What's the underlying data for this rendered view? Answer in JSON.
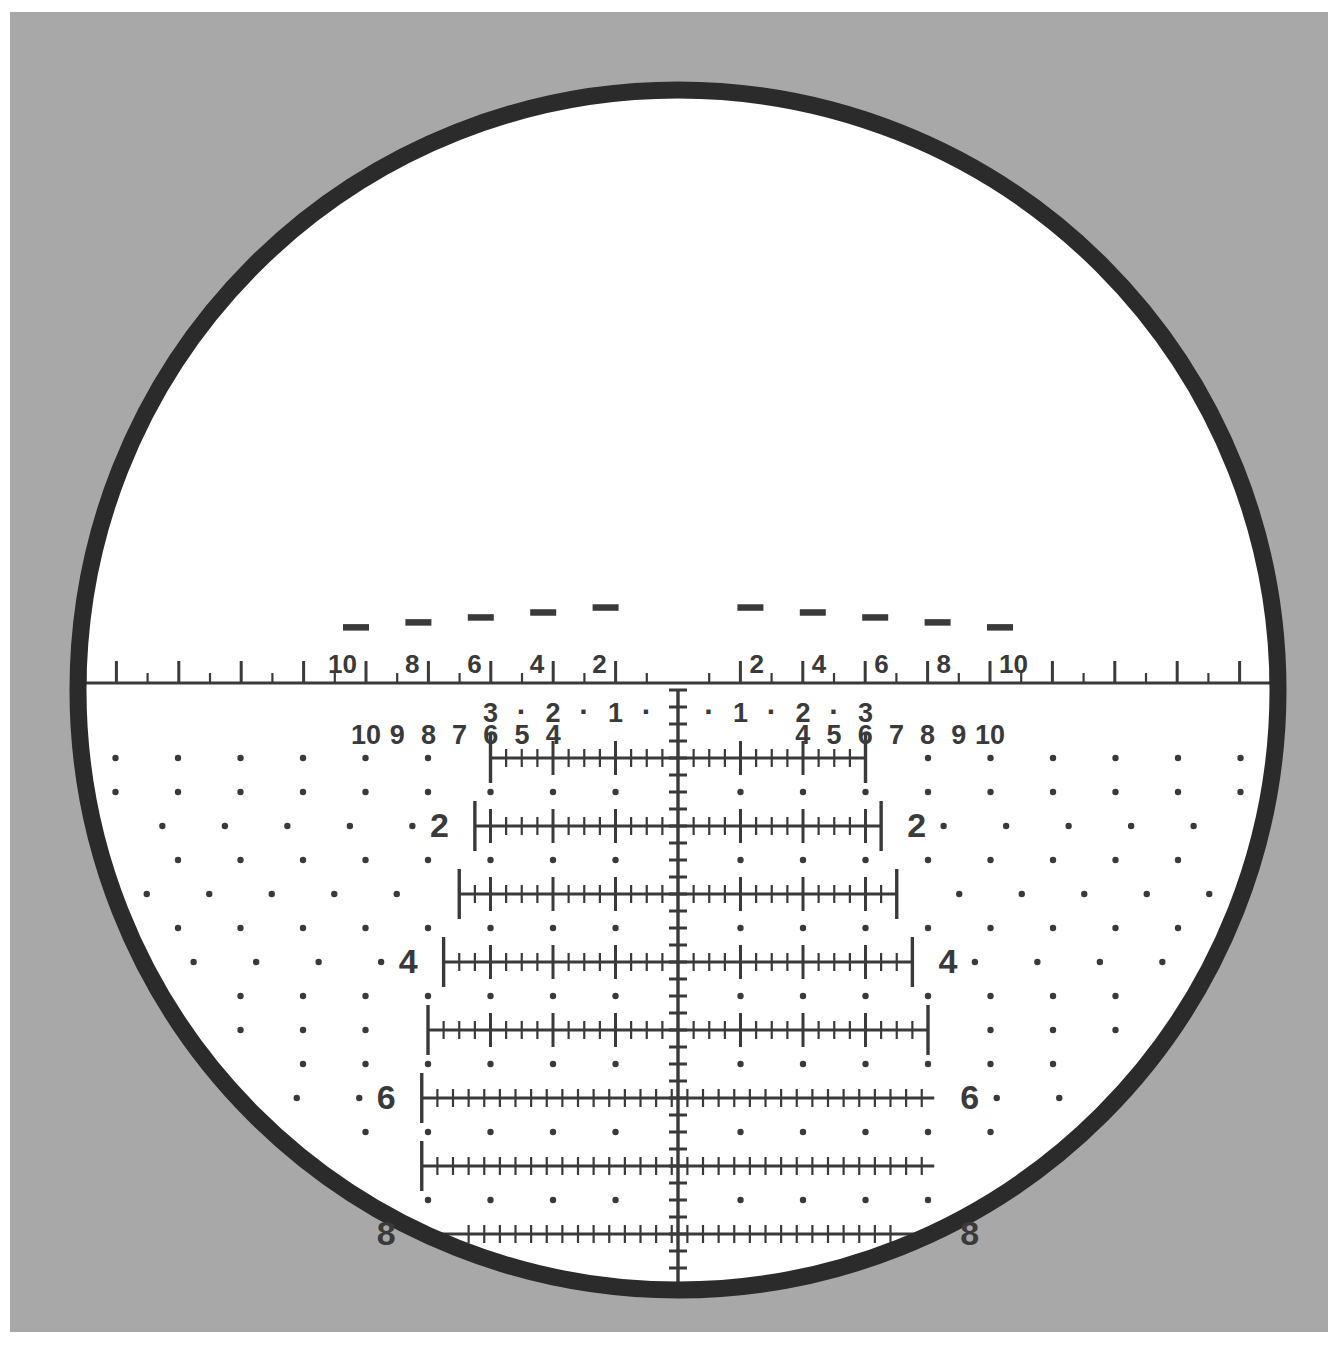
{
  "view": {
    "title": "Riflescope Reticle View",
    "background_color": "#a8a8a8",
    "page_color": "#ffffff",
    "field_color": "#ffffff",
    "ring_color": "#2b2b2b",
    "reticle_color": "#3a3a3a",
    "width": 1338,
    "height": 1354
  },
  "scope": {
    "center_x": 678,
    "center_y": 690,
    "field_radius": 600,
    "ring_thickness": 17,
    "name": "scope-field"
  },
  "center_post": {
    "name": "center-aiming-post",
    "description": "bulb shaped post with thin vertical stem",
    "stem_top_y": 550,
    "bulb_bottom_y": 688,
    "bulb_half_width": 27
  },
  "top_windage_scale": {
    "name": "top-windage-scale",
    "axis_y": 683,
    "left_end_x": 52,
    "right_end_x": 1304,
    "px_per_unit": 31.2,
    "minor_tick_len": 10,
    "major_tick_len": 22,
    "label_offset_y": -8,
    "labels_left": [
      "10",
      "8",
      "6",
      "4",
      "2"
    ],
    "labels_right": [
      "2",
      "4",
      "6",
      "8",
      "10"
    ],
    "label_values_left": [
      10,
      8,
      6,
      4,
      2
    ],
    "label_values_right": [
      2,
      4,
      6,
      8,
      10
    ],
    "dash_marks": {
      "name": "ranging-dash-marks",
      "values": [
        10,
        8,
        6,
        4,
        2
      ],
      "dash_width": 26,
      "dash_heights_px": [
        22,
        30,
        38,
        46,
        54
      ]
    }
  },
  "lower_windage_numbers": {
    "name": "lower-windage-number-row",
    "row_y": 744,
    "left": [
      "10",
      "9",
      "8",
      "7",
      "6",
      "5",
      "4"
    ],
    "right": [
      "4",
      "5",
      "6",
      "7",
      "8",
      "9",
      "10"
    ],
    "left_values": [
      10,
      9,
      8,
      7,
      6,
      5,
      4
    ],
    "right_values": [
      4,
      5,
      6,
      7,
      8,
      9,
      10
    ]
  },
  "center_windage_row": {
    "name": "center-windage-label-row",
    "row_y": 722,
    "left": [
      "3",
      "·",
      "2",
      "·",
      "1",
      "·"
    ],
    "right": [
      "·",
      "1",
      "·",
      "2",
      "·",
      "3"
    ],
    "left_values": [
      3,
      2.5,
      2,
      1.5,
      1,
      0.5
    ],
    "right_values": [
      0.5,
      1,
      1.5,
      2,
      2.5,
      3
    ]
  },
  "holdover_ladder": {
    "name": "holdover-ladder",
    "unit_px": 62.5,
    "row_spacing_px": 68,
    "first_row_y": 758,
    "rows": [
      {
        "index": 1,
        "label": "",
        "y": 758,
        "half_width_units": 3.0,
        "labeled": false
      },
      {
        "index": 2,
        "label": "2",
        "y": 826,
        "half_width_units": 3.25,
        "labeled": true
      },
      {
        "index": 3,
        "label": "",
        "y": 894,
        "half_width_units": 3.5,
        "labeled": false
      },
      {
        "index": 4,
        "label": "4",
        "y": 962,
        "half_width_units": 3.75,
        "labeled": true
      },
      {
        "index": 5,
        "label": "",
        "y": 1030,
        "half_width_units": 4.0,
        "labeled": false
      },
      {
        "index": 6,
        "label": "6",
        "y": 1098,
        "half_width_units": 4.1,
        "labeled": true
      },
      {
        "index": 7,
        "label": "",
        "y": 1166,
        "half_width_units": 4.1,
        "labeled": false
      },
      {
        "index": 8,
        "label": "8",
        "y": 1234,
        "half_width_units": 4.1,
        "labeled": true
      },
      {
        "index": 9,
        "label": "",
        "y": 1302,
        "half_width_units": 3.3,
        "labeled": false
      }
    ],
    "tick_minor_len": 9,
    "tick_major_len": 17,
    "tick_end_len": 25,
    "minor_step_units": 0.25,
    "major_step_units": 1.0
  },
  "vertical_axis": {
    "name": "vertical-center-axis",
    "top_y": 690,
    "bottom_y": 1330,
    "tick_half_len": 9,
    "tick_step_px": 17
  },
  "dot_field": {
    "name": "ranging-dot-field",
    "dot_radius": 3.2,
    "col_step_px": 62.5,
    "description": "grid of dots outside the ladder rows, on half-row lines and row lines"
  },
  "labels": {
    "ladder_left_numbers": [
      "2",
      "4",
      "6",
      "8"
    ],
    "ladder_right_numbers": [
      "2",
      "4",
      "6",
      "8"
    ]
  }
}
